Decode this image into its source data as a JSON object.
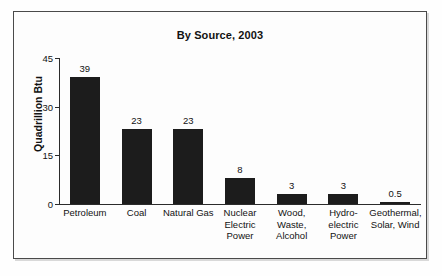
{
  "figure": {
    "title": "By Source, 2003"
  },
  "chart_data": {
    "type": "bar",
    "title": "By Source, 2003",
    "xlabel": "",
    "ylabel": "Quadrillion Btu",
    "ylim": [
      0,
      45
    ],
    "yticks": [
      0,
      15,
      30,
      45
    ],
    "ytick_labels": [
      "0",
      "15",
      "30",
      "45"
    ],
    "grid": false,
    "legend": null,
    "bar_color": "#1c1c1c",
    "categories": [
      "Petroleum",
      "Coal",
      "Natural Gas",
      "Nuclear Electric Power",
      "Wood, Waste, Alcohol",
      "Hydro-electric Power",
      "Geothermal, Solar, Wind"
    ],
    "category_lines": [
      [
        "Petroleum"
      ],
      [
        "Coal"
      ],
      [
        "Natural Gas"
      ],
      [
        "Nuclear",
        "Electric",
        "Power"
      ],
      [
        "Wood,",
        "Waste,",
        "Alcohol"
      ],
      [
        "Hydro-",
        "electric",
        "Power"
      ],
      [
        "Geothermal,",
        "Solar, Wind"
      ]
    ],
    "values": [
      39,
      23,
      23,
      8,
      3,
      3,
      0.5
    ],
    "value_labels": [
      "39",
      "23",
      "23",
      "8",
      "3",
      "3",
      "0.5"
    ]
  }
}
